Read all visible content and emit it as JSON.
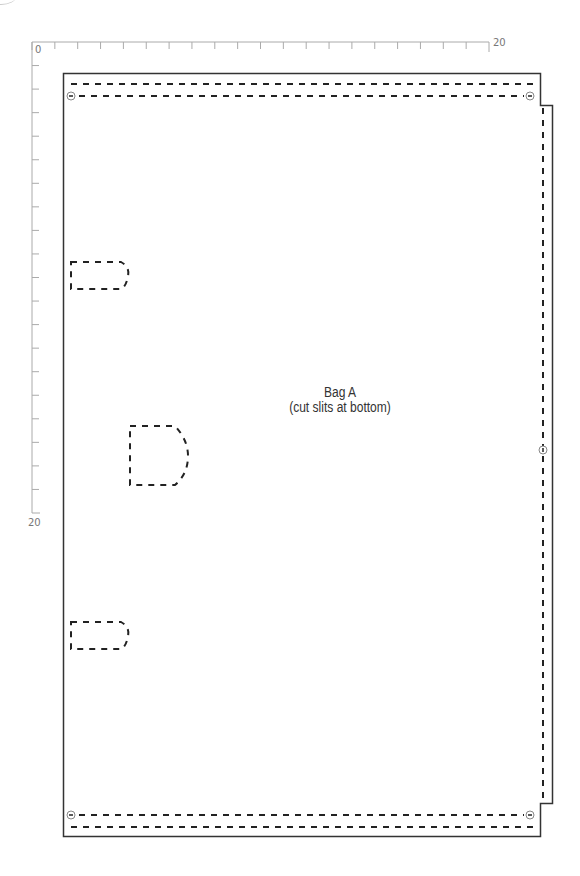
{
  "pattern": {
    "title": "Bag A",
    "subtitle": "(cut slits at bottom)"
  },
  "ruler": {
    "horizontal": {
      "start_label": "0",
      "end_label": "20",
      "divisions": 20
    },
    "vertical": {
      "start_label": "0",
      "end_label": "20",
      "divisions": 20
    }
  },
  "colors": {
    "outline": "#333333",
    "dash": "#222222",
    "ruler": "#aaaaaa",
    "ruler_text": "#777777",
    "marker": "#888888"
  },
  "elements": {
    "outline": "cut line (solid) with stepped right edge",
    "stitch_lines": [
      "top-double-dashed",
      "bottom-double-dashed",
      "right-vertical-dashed"
    ],
    "markers": [
      "top-left",
      "top-right",
      "right-middle",
      "bottom-left",
      "bottom-right"
    ],
    "slots": [
      "upper-small-slot",
      "middle-large-slot",
      "lower-small-slot"
    ]
  }
}
